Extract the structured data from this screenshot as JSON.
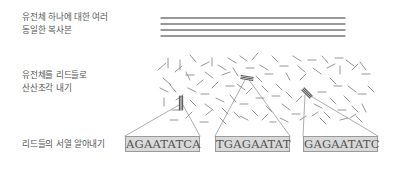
{
  "steps": [
    {
      "lines": [
        "유전체 하나에 대한 여러",
        "동일한 복사본"
      ]
    },
    {
      "lines": [
        "유전체를 리드들로",
        "산산조각 내기"
      ]
    },
    {
      "lines": [
        "리드들의 서열 알아내기"
      ]
    }
  ],
  "genome_copies": {
    "count": 4,
    "x1": 161,
    "x2": 345,
    "ys": [
      18,
      24,
      30,
      36
    ],
    "color": "#777777"
  },
  "reads": [
    [
      158,
      70,
      166,
      63
    ],
    [
      163,
      78,
      171,
      85
    ],
    [
      168,
      58,
      168,
      68
    ],
    [
      175,
      72,
      182,
      66
    ],
    [
      180,
      60,
      180,
      70
    ],
    [
      186,
      75,
      194,
      75
    ],
    [
      190,
      55,
      196,
      62
    ],
    [
      201,
      66,
      209,
      62
    ],
    [
      205,
      72,
      213,
      78
    ],
    [
      212,
      58,
      212,
      66
    ],
    [
      218,
      65,
      226,
      70
    ],
    [
      222,
      75,
      230,
      72
    ],
    [
      228,
      58,
      236,
      63
    ],
    [
      233,
      68,
      238,
      76
    ],
    [
      240,
      56,
      247,
      61
    ],
    [
      246,
      68,
      254,
      68
    ],
    [
      252,
      60,
      258,
      53
    ],
    [
      260,
      65,
      268,
      70
    ],
    [
      265,
      74,
      273,
      74
    ],
    [
      272,
      56,
      278,
      62
    ],
    [
      280,
      66,
      288,
      66
    ],
    [
      286,
      73,
      290,
      80
    ],
    [
      293,
      56,
      301,
      61
    ],
    [
      298,
      66,
      305,
      72
    ],
    [
      308,
      60,
      316,
      60
    ],
    [
      313,
      68,
      321,
      74
    ],
    [
      322,
      56,
      328,
      63
    ],
    [
      327,
      68,
      335,
      64
    ],
    [
      335,
      58,
      343,
      58
    ],
    [
      340,
      66,
      340,
      74
    ],
    [
      346,
      60,
      354,
      66
    ],
    [
      352,
      70,
      358,
      64
    ],
    [
      360,
      62,
      366,
      70
    ],
    [
      362,
      74,
      370,
      74
    ],
    [
      160,
      88,
      168,
      92
    ],
    [
      164,
      98,
      164,
      106
    ],
    [
      170,
      85,
      176,
      92
    ],
    [
      172,
      110,
      180,
      110
    ],
    [
      176,
      100,
      183,
      95
    ],
    [
      188,
      88,
      196,
      92
    ],
    [
      190,
      100,
      196,
      106
    ],
    [
      197,
      85,
      203,
      80
    ],
    [
      201,
      94,
      209,
      94
    ],
    [
      205,
      104,
      213,
      110
    ],
    [
      212,
      88,
      218,
      82
    ],
    [
      216,
      98,
      224,
      102
    ],
    [
      222,
      108,
      228,
      114
    ],
    [
      226,
      86,
      234,
      86
    ],
    [
      230,
      95,
      236,
      102
    ],
    [
      237,
      84,
      245,
      90
    ],
    [
      240,
      104,
      248,
      104
    ],
    [
      246,
      94,
      252,
      88
    ],
    [
      252,
      110,
      258,
      116
    ],
    [
      256,
      98,
      264,
      98
    ],
    [
      262,
      86,
      268,
      92
    ],
    [
      266,
      106,
      272,
      112
    ],
    [
      272,
      96,
      280,
      96
    ],
    [
      276,
      84,
      282,
      90
    ],
    [
      282,
      104,
      290,
      110
    ],
    [
      286,
      92,
      292,
      98
    ],
    [
      292,
      114,
      300,
      114
    ],
    [
      296,
      102,
      302,
      96
    ],
    [
      314,
      104,
      322,
      108
    ],
    [
      318,
      92,
      326,
      92
    ],
    [
      324,
      112,
      330,
      118
    ],
    [
      330,
      98,
      336,
      104
    ],
    [
      334,
      86,
      342,
      86
    ],
    [
      338,
      110,
      346,
      110
    ],
    [
      344,
      96,
      350,
      102
    ],
    [
      348,
      86,
      356,
      92
    ],
    [
      352,
      106,
      358,
      112
    ],
    [
      358,
      94,
      366,
      94
    ],
    [
      362,
      104,
      366,
      112
    ],
    [
      368,
      86,
      374,
      92
    ],
    [
      170,
      120,
      178,
      120
    ],
    [
      186,
      118,
      192,
      112
    ],
    [
      200,
      122,
      208,
      122
    ],
    [
      220,
      118,
      226,
      124
    ],
    [
      240,
      116,
      248,
      120
    ],
    [
      262,
      120,
      268,
      114
    ],
    [
      280,
      118,
      288,
      122
    ],
    [
      300,
      120,
      306,
      116
    ],
    [
      320,
      118,
      326,
      124
    ],
    [
      340,
      120,
      348,
      118
    ],
    [
      356,
      116,
      362,
      122
    ],
    [
      186,
      72,
      190,
      80
    ],
    [
      256,
      76,
      262,
      82
    ],
    [
      300,
      80,
      306,
      74
    ],
    [
      330,
      78,
      336,
      84
    ],
    [
      206,
      115,
      212,
      110
    ],
    [
      234,
      112,
      240,
      118
    ],
    [
      270,
      122,
      276,
      122
    ],
    [
      312,
      116,
      318,
      112
    ],
    [
      350,
      118,
      356,
      114
    ]
  ],
  "highlighted_reads": [
    {
      "x1": 181,
      "y1": 96,
      "x2": 181,
      "y2": 110,
      "box_left": 125,
      "box_right": 200
    },
    {
      "x1": 241,
      "y1": 77,
      "x2": 253,
      "y2": 79,
      "box_left": 215,
      "box_right": 290
    },
    {
      "x1": 303,
      "y1": 89,
      "x2": 311,
      "y2": 97,
      "box_left": 303,
      "box_right": 378
    }
  ],
  "sequences": [
    {
      "text": "AGAATATCA",
      "left": 125,
      "width": 75
    },
    {
      "text": "TGAGAATAT",
      "left": 215,
      "width": 75
    },
    {
      "text": "GAGAATATC",
      "left": 303,
      "width": 75
    }
  ],
  "colors": {
    "read": "#8a8a8a",
    "highlight": "#5a5a5a",
    "zoom_line": "#999999",
    "box_fill": "#d9d9d9"
  }
}
